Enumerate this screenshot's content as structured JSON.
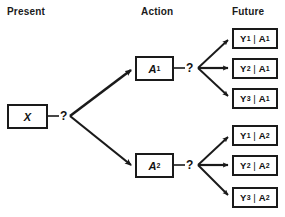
{
  "diagram": {
    "columns": {
      "present_label": "Present",
      "action_label": "Action",
      "future_label": "Future"
    },
    "decision_marks": {
      "root": "?",
      "after_a1": "?",
      "after_a2": "?"
    },
    "present": {
      "node_id": "X",
      "label": "X"
    },
    "actions": [
      {
        "node_id": "A1",
        "label": "A",
        "subscript": "1"
      },
      {
        "node_id": "A2",
        "label": "A",
        "subscript": "2"
      }
    ],
    "outcomes": [
      {
        "node_id": "Y1A1",
        "y": "Y",
        "y_sub": "1",
        "bar": "|",
        "a": "A",
        "a_sub": "1"
      },
      {
        "node_id": "Y2A1",
        "y": "Y",
        "y_sub": "2",
        "bar": "|",
        "a": "A",
        "a_sub": "1"
      },
      {
        "node_id": "Y3A1",
        "y": "Y",
        "y_sub": "3",
        "bar": "|",
        "a": "A",
        "a_sub": "1"
      },
      {
        "node_id": "Y1A2",
        "y": "Y",
        "y_sub": "1",
        "bar": "|",
        "a": "A",
        "a_sub": "2"
      },
      {
        "node_id": "Y2A2",
        "y": "Y",
        "y_sub": "2",
        "bar": "|",
        "a": "A",
        "a_sub": "2"
      },
      {
        "node_id": "Y3A2",
        "y": "Y",
        "y_sub": "3",
        "bar": "|",
        "a": "A",
        "a_sub": "2"
      }
    ],
    "colors": {
      "stroke": "#1a1a1a",
      "text": "#111111",
      "background": "#ffffff"
    }
  }
}
